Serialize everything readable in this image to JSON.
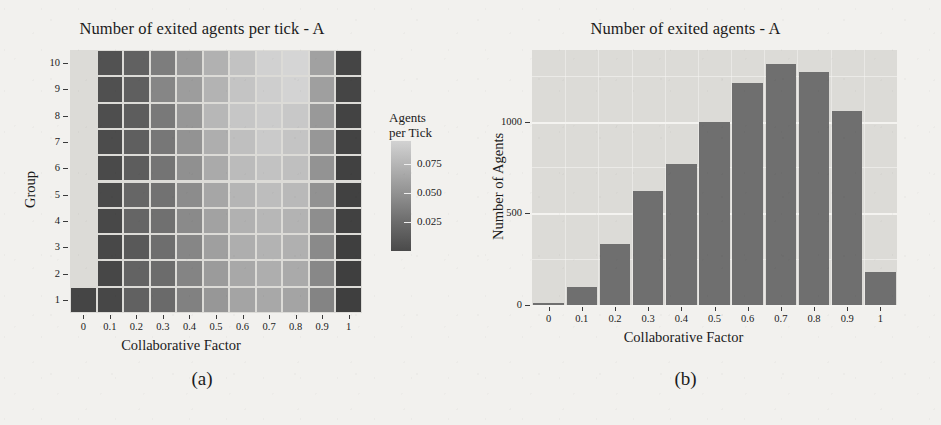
{
  "figure": {
    "panel_a": {
      "title": "Number of exited agents per tick - A",
      "caption": "(a)",
      "xlabel": "Collaborative Factor",
      "ylabel": "Group",
      "legend_title_line1": "Agents",
      "legend_title_line2": "per Tick",
      "legend_labels": [
        "0.075",
        "0.050",
        "0.025"
      ]
    },
    "panel_b": {
      "title": "Number of exited agents - A",
      "caption": "(b)",
      "xlabel": "Collaborative Factor",
      "ylabel": "Number of Agents"
    }
  },
  "chart_data": [
    {
      "type": "heatmap",
      "title": "Number of exited agents per tick - A",
      "xlabel": "Collaborative Factor",
      "ylabel": "Group",
      "legend_title": "Agents per Tick",
      "x": [
        "0",
        "0.1",
        "0.2",
        "0.3",
        "0.4",
        "0.5",
        "0.6",
        "0.7",
        "0.8",
        "0.9",
        "1"
      ],
      "y": [
        "1",
        "2",
        "3",
        "4",
        "5",
        "6",
        "7",
        "8",
        "9",
        "10"
      ],
      "colorbar": {
        "ticks": [
          0.025,
          0.05,
          0.075
        ],
        "tick_labels": [
          "0.025",
          "0.050",
          "0.075"
        ],
        "low_color": "#3f3f3f",
        "high_color": "#d5d5d5",
        "orientation": "vertical",
        "position": "right"
      },
      "grid": true,
      "note": "Cell at Collaborative Factor = 0 exists only for Group 1; all other Group rows have no cell at 0.",
      "rows": [
        {
          "group": "10",
          "values": [
            null,
            0.02,
            0.028,
            0.043,
            0.058,
            0.071,
            0.08,
            0.088,
            0.09,
            0.062,
            0.013
          ]
        },
        {
          "group": "9",
          "values": [
            null,
            0.019,
            0.027,
            0.048,
            0.06,
            0.072,
            0.081,
            0.086,
            0.089,
            0.061,
            0.013
          ]
        },
        {
          "group": "8",
          "values": [
            null,
            0.018,
            0.026,
            0.041,
            0.057,
            0.074,
            0.082,
            0.085,
            0.083,
            0.058,
            0.012
          ]
        },
        {
          "group": "7",
          "values": [
            null,
            0.017,
            0.027,
            0.04,
            0.055,
            0.069,
            0.078,
            0.084,
            0.081,
            0.057,
            0.012
          ]
        },
        {
          "group": "6",
          "values": [
            null,
            0.016,
            0.026,
            0.038,
            0.053,
            0.067,
            0.076,
            0.08,
            0.078,
            0.055,
            0.011
          ]
        },
        {
          "group": "5",
          "values": [
            null,
            0.016,
            0.031,
            0.037,
            0.051,
            0.065,
            0.073,
            0.077,
            0.075,
            0.054,
            0.011
          ]
        },
        {
          "group": "4",
          "values": [
            null,
            0.015,
            0.03,
            0.036,
            0.05,
            0.063,
            0.071,
            0.074,
            0.072,
            0.052,
            0.011
          ]
        },
        {
          "group": "3",
          "values": [
            null,
            0.015,
            0.024,
            0.035,
            0.048,
            0.061,
            0.069,
            0.072,
            0.07,
            0.05,
            0.01
          ]
        },
        {
          "group": "2",
          "values": [
            null,
            0.014,
            0.029,
            0.034,
            0.047,
            0.059,
            0.066,
            0.069,
            0.067,
            0.049,
            0.01
          ]
        },
        {
          "group": "1",
          "values": [
            0.013,
            0.014,
            0.028,
            0.033,
            0.045,
            0.057,
            0.064,
            0.066,
            0.064,
            0.047,
            0.01
          ]
        }
      ]
    },
    {
      "type": "bar",
      "title": "Number of exited agents - A",
      "xlabel": "Collaborative Factor",
      "ylabel": "Number of Agents",
      "categories": [
        "0",
        "0.1",
        "0.2",
        "0.3",
        "0.4",
        "0.5",
        "0.6",
        "0.7",
        "0.8",
        "0.9",
        "1"
      ],
      "values": [
        10,
        100,
        335,
        620,
        770,
        1000,
        1210,
        1315,
        1270,
        1055,
        180
      ],
      "ytick_labels": [
        "0",
        "500",
        "1000"
      ],
      "yticks": [
        0,
        500,
        1000
      ],
      "ylim": [
        0,
        1390
      ],
      "bar_color": "#6f6f6f",
      "panel_background": "#dcdbd7",
      "grid": true
    }
  ]
}
